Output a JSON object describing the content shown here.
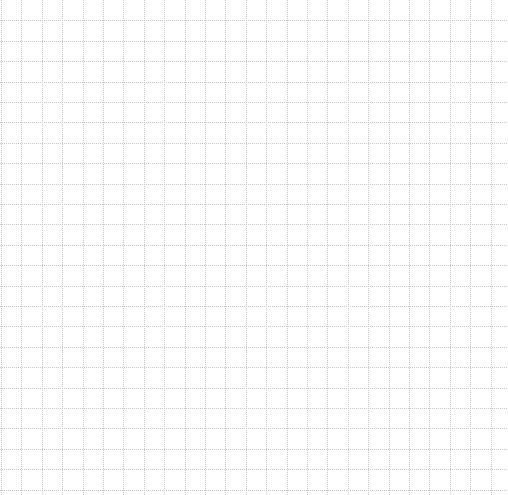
{
  "sheet": {
    "type": "graph-paper",
    "background": "#ffffff",
    "line_color": "#c8c8c8",
    "line_style": "dotted",
    "cell_size": 20.4,
    "offset_x": 1,
    "offset_y": 0,
    "columns": 25,
    "rows": 24
  }
}
